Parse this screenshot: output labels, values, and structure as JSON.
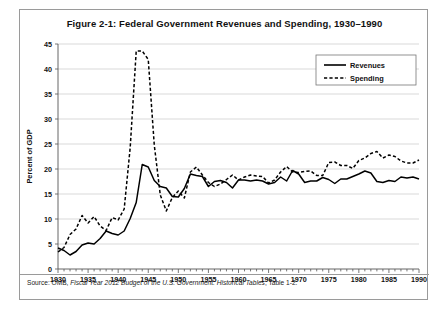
{
  "figure": {
    "title": "Figure 2-1: Federal Government Revenues and Spending, 1930–1990",
    "source_prefix": "Source: OMB, ",
    "source_italic": "Fiscal Year 2012 Budget of the U.S. Government: Historical Tables",
    "source_suffix": ", Table 1-2."
  },
  "legend": {
    "revenues_label": "Revenues",
    "spending_label": "Spending"
  },
  "chart_data": {
    "type": "line",
    "title": "Figure 2-1: Federal Government Revenues and Spending, 1930–1990",
    "xlabel": "",
    "ylabel": "Percent of GDP",
    "xlim": [
      1930,
      1990
    ],
    "ylim": [
      0,
      45
    ],
    "ytick_step": 5,
    "yticks": [
      0,
      5,
      10,
      15,
      20,
      25,
      30,
      35,
      40,
      45
    ],
    "xticks_labeled": [
      1930,
      1935,
      1940,
      1945,
      1950,
      1955,
      1960,
      1965,
      1970,
      1975,
      1980,
      1985,
      1990
    ],
    "xtick_interval": 1,
    "grid": "horizontal",
    "legend_position": "top-right",
    "x": [
      1930,
      1931,
      1932,
      1933,
      1934,
      1935,
      1936,
      1937,
      1938,
      1939,
      1940,
      1941,
      1942,
      1943,
      1944,
      1945,
      1946,
      1947,
      1948,
      1949,
      1950,
      1951,
      1952,
      1953,
      1954,
      1955,
      1956,
      1957,
      1958,
      1959,
      1960,
      1961,
      1962,
      1963,
      1964,
      1965,
      1966,
      1967,
      1968,
      1969,
      1970,
      1971,
      1972,
      1973,
      1974,
      1975,
      1976,
      1977,
      1978,
      1979,
      1980,
      1981,
      1982,
      1983,
      1984,
      1985,
      1986,
      1987,
      1988,
      1989,
      1990
    ],
    "series": [
      {
        "name": "Revenues",
        "style": "solid",
        "color": "#000000",
        "values": [
          4.2,
          3.7,
          2.8,
          3.5,
          4.8,
          5.2,
          5.0,
          6.1,
          7.6,
          7.1,
          6.8,
          7.6,
          10.1,
          13.3,
          20.9,
          20.4,
          17.7,
          16.5,
          16.2,
          14.5,
          14.4,
          16.1,
          19.0,
          18.7,
          18.5,
          16.5,
          17.5,
          17.7,
          17.3,
          16.2,
          17.8,
          17.8,
          17.6,
          17.8,
          17.6,
          17.0,
          17.3,
          18.4,
          17.6,
          19.7,
          19.0,
          17.3,
          17.6,
          17.6,
          18.3,
          17.9,
          17.1,
          18.0,
          18.0,
          18.5,
          19.0,
          19.6,
          19.2,
          17.5,
          17.3,
          17.7,
          17.5,
          18.4,
          18.2,
          18.4,
          18.0
        ]
      },
      {
        "name": "Spending",
        "style": "dashed",
        "color": "#000000",
        "values": [
          3.4,
          4.3,
          6.9,
          8.0,
          10.7,
          9.2,
          10.5,
          8.6,
          7.7,
          10.3,
          9.8,
          12.0,
          24.3,
          43.6,
          43.6,
          41.9,
          24.8,
          14.8,
          11.6,
          14.3,
          15.6,
          14.2,
          19.4,
          20.4,
          18.8,
          17.3,
          16.5,
          17.0,
          17.9,
          18.8,
          17.8,
          18.4,
          18.8,
          18.6,
          18.5,
          17.2,
          17.8,
          19.4,
          20.5,
          19.4,
          19.3,
          19.5,
          19.6,
          18.7,
          18.7,
          21.3,
          21.4,
          20.7,
          20.7,
          20.1,
          21.7,
          22.2,
          23.1,
          23.5,
          22.2,
          22.8,
          22.5,
          21.6,
          21.2,
          21.2,
          21.8
        ]
      }
    ]
  }
}
